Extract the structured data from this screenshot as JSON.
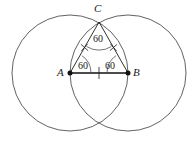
{
  "figure": {
    "background_color": "#ffffff",
    "stroke_color": "#1a1a1a",
    "thin_stroke_color": "#404040",
    "width": 192,
    "height": 145
  },
  "vertices": {
    "A": {
      "label": "A",
      "x": 70,
      "y": 73
    },
    "B": {
      "label": "B",
      "x": 128,
      "y": 73
    },
    "C": {
      "label": "C",
      "x": 99,
      "y": 22
    }
  },
  "angles": {
    "at_C": "60",
    "at_A": "60",
    "at_B": "60"
  },
  "circles": [
    {
      "name": "circle-centered-A",
      "cx": 70,
      "cy": 73,
      "r": 58
    },
    {
      "name": "circle-centered-B",
      "cx": 128,
      "cy": 73,
      "r": 58
    }
  ],
  "segments": [
    {
      "name": "segment-AB",
      "x1": 70,
      "y1": 73,
      "x2": 128,
      "y2": 73
    },
    {
      "name": "segment-AC",
      "x1": 70,
      "y1": 73,
      "x2": 99,
      "y2": 22
    },
    {
      "name": "segment-BC",
      "x1": 128,
      "y1": 73,
      "x2": 99,
      "y2": 22
    }
  ],
  "tick_marks": [
    {
      "name": "tick-segment-AC",
      "x": 84.5,
      "y": 47.5,
      "glyph": "cross"
    },
    {
      "name": "tick-segment-BC",
      "x": 113.5,
      "y": 47.5,
      "glyph": "cross"
    },
    {
      "name": "tick-segment-AB",
      "x": 99,
      "y": 73,
      "glyph": "bar"
    }
  ],
  "intersection_points": [
    {
      "name": "upper-intersection",
      "x": 99,
      "y": 22
    },
    {
      "name": "lower-intersection",
      "x": 99,
      "y": 124
    }
  ]
}
